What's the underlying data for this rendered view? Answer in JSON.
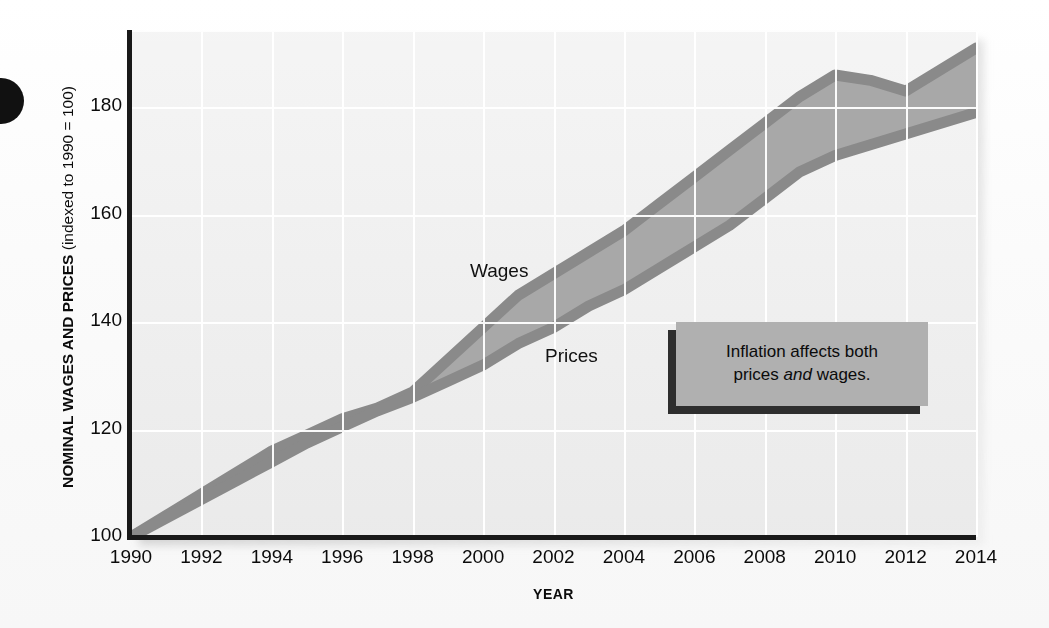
{
  "figure": {
    "y_axis_title_bold": "NOMINAL WAGES AND PRICES",
    "y_axis_title_regular": "(indexed to 1990 = 100)",
    "x_axis_title": "YEAR"
  },
  "callout": {
    "line1": "Inflation affects both",
    "line2_pre": "prices ",
    "line2_em": "and",
    "line2_post": " wages."
  },
  "series_labels": {
    "wages": "Wages",
    "prices": "Prices"
  },
  "colors": {
    "panel_background": "#ececec",
    "gridline": "#ffffff",
    "axis": "#191919",
    "band_edge": "#8a8a8a",
    "band_fill": "#a8a8a8",
    "callout_fill": "#b0b0b0",
    "callout_shadow": "#2e2e2e",
    "text": "#0b0b0b"
  },
  "ghost_text": [
    {
      "text": "the price level rises, the purchasing power of money falls",
      "left": 200,
      "top": 96
    },
    {
      "text": "measured by the consumer price index over the period",
      "left": 178,
      "top": 214
    },
    {
      "text": "nominal wages tend to rise along with prices in the",
      "left": 196,
      "top": 238
    },
    {
      "text": "long run, so real wages are less affected than",
      "left": 210,
      "top": 262
    },
    {
      "text": "one might expect from inflation alone",
      "left": 222,
      "top": 286
    },
    {
      "text": "average hourly earnings and the CPI",
      "left": 206,
      "top": 322
    },
    {
      "text": "both indexed to a base year",
      "left": 228,
      "top": 346
    },
    {
      "text": "wage growth exceeded price growth",
      "left": 190,
      "top": 404
    },
    {
      "text": "in most years after 1998",
      "left": 214,
      "top": 428
    }
  ],
  "chart_data": {
    "type": "area",
    "title": "",
    "xlabel": "YEAR",
    "ylabel": "NOMINAL WAGES AND PRICES (indexed to 1990 = 100)",
    "xlim": [
      1990,
      2014
    ],
    "ylim": [
      100,
      194
    ],
    "xticks": [
      1990,
      1992,
      1994,
      1996,
      1998,
      2000,
      2002,
      2004,
      2006,
      2008,
      2010,
      2012,
      2014
    ],
    "yticks": [
      100,
      120,
      140,
      160,
      180
    ],
    "grid": true,
    "legend": "inline-labels",
    "x": [
      1990,
      1991,
      1992,
      1993,
      1994,
      1995,
      1996,
      1997,
      1998,
      1999,
      2000,
      2001,
      2002,
      2003,
      2004,
      2005,
      2006,
      2007,
      2008,
      2009,
      2010,
      2011,
      2012,
      2013,
      2014
    ],
    "series": [
      {
        "name": "Wages",
        "values": [
          100,
          104,
          108,
          112,
          116,
          119,
          122,
          124,
          127,
          133,
          139,
          145,
          149,
          153,
          157,
          162,
          167,
          172,
          177,
          182,
          186,
          185,
          183,
          187,
          191
        ]
      },
      {
        "name": "Prices",
        "values": [
          100,
          103.5,
          107,
          110.5,
          114,
          117.5,
          120.5,
          123.5,
          126,
          129,
          132,
          136,
          139,
          143,
          146,
          150,
          154,
          158,
          163,
          168,
          171,
          173,
          175,
          177,
          179
        ]
      }
    ]
  }
}
